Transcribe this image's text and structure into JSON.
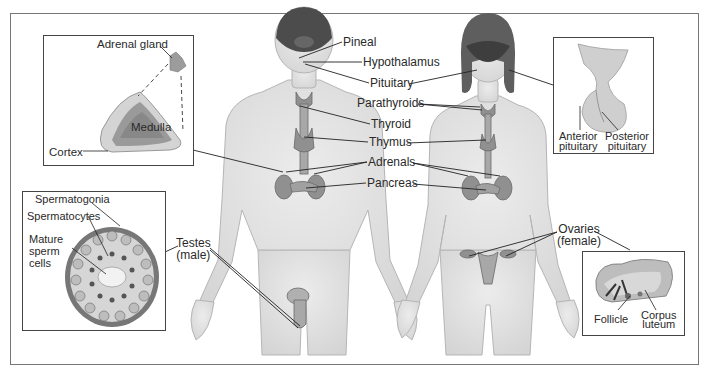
{
  "diagram": {
    "type": "anatomical-diagram",
    "figures": [
      "male body",
      "female body"
    ],
    "labels": {
      "pineal": "Pineal",
      "hypothalamus": "Hypothalamus",
      "pituitary": "Pituitary",
      "parathyroids": "Parathyroids",
      "thyroid": "Thyroid",
      "thymus": "Thymus",
      "adrenals": "Adrenals",
      "pancreas": "Pancreas",
      "testes_line1": "Testes",
      "testes_line2": "(male)",
      "ovaries_line1": "Ovaries",
      "ovaries_line2": "(female)"
    },
    "insets": {
      "adrenal": {
        "gland": "Adrenal gland",
        "medulla": "Medulla",
        "cortex": "Cortex"
      },
      "testis": {
        "spermatogonia": "Spermatogonia",
        "spermatocytes": "Spermatocytes",
        "mature_line1": "Mature",
        "mature_line2": "sperm",
        "mature_line3": "cells"
      },
      "pituitary": {
        "anterior_line1": "Anterior",
        "anterior_line2": "pituitary",
        "posterior_line1": "Posterior",
        "posterior_line2": "pituitary"
      },
      "ovary": {
        "follicle": "Follicle",
        "corpus_line1": "Corpus",
        "corpus_line2": "luteum"
      }
    },
    "colors": {
      "skin": "#e4e4e4",
      "skin_edge": "#b8b8b8",
      "organ": "#8c8c8c",
      "organ_dark": "#5a5a5a",
      "brain": "#4a4a4a",
      "line": "#222222"
    }
  }
}
